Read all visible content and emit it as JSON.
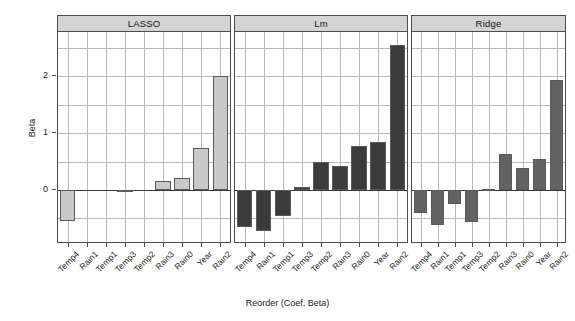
{
  "chart_data": {
    "type": "bar",
    "title": "",
    "xlabel": "Reorder (Coef, Beta)",
    "ylabel": "Beta",
    "categories": [
      "Temp4",
      "Rain1",
      "Temp1",
      "Temp3",
      "Temp2",
      "Rain3",
      "Rain0",
      "Year",
      "Rain2"
    ],
    "ylim": [
      -0.95,
      2.78
    ],
    "yticks": [
      0,
      1,
      2
    ],
    "ytick_labels": [
      "0",
      "1",
      "2"
    ],
    "grid": true,
    "legend": "none",
    "panel_layout": "horizontal-facets",
    "panels": [
      {
        "label": "LASSO",
        "fill": "#c9c9c9",
        "categories": [
          "Temp4",
          "Rain1",
          "Temp1",
          "Temp3",
          "Temp2",
          "Rain3",
          "Rain0",
          "Year",
          "Rain2"
        ],
        "values": [
          -0.55,
          0.0,
          0.0,
          -0.02,
          0.0,
          0.16,
          0.22,
          0.74,
          2.0
        ]
      },
      {
        "label": "Lm",
        "fill": "#3b3b3b",
        "categories": [
          "Temp4",
          "Rain1",
          "Temp1",
          "Temp3",
          "Temp2",
          "Rain3",
          "Rain0",
          "Year",
          "Rain2"
        ],
        "values": [
          -0.65,
          -0.72,
          -0.46,
          0.06,
          0.5,
          0.43,
          0.78,
          0.85,
          2.55
        ]
      },
      {
        "label": "Ridge",
        "fill": "#636363",
        "categories": [
          "Temp4",
          "Rain1",
          "Temp1",
          "Temp3",
          "Temp2",
          "Rain3",
          "Rain0",
          "Year",
          "Rain2"
        ],
        "values": [
          -0.4,
          -0.62,
          -0.25,
          -0.57,
          0.02,
          0.63,
          0.38,
          0.54,
          1.93
        ]
      }
    ]
  },
  "colors": {
    "lasso_bar": "#c9c9c9",
    "lm_bar": "#3b3b3b",
    "ridge_bar": "#636363",
    "grid": "#b9b9b9",
    "axis": "#4d4d4d",
    "strip_bg": "#d4d4d4",
    "background": "#ffffff"
  }
}
